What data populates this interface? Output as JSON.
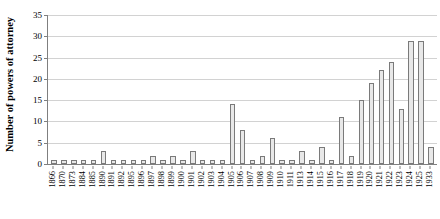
{
  "chart_data": {
    "type": "bar",
    "title": "",
    "subtitle": "",
    "xlabel": "",
    "ylabel": "Number of powers of attorney",
    "ylim": [
      0,
      35
    ],
    "yticks": [
      0,
      5,
      10,
      15,
      20,
      25,
      30,
      35
    ],
    "grid": true,
    "legend": null,
    "categories": [
      "1866",
      "1870",
      "1873",
      "1884",
      "1885",
      "1890",
      "1891",
      "1892",
      "1895",
      "1896",
      "1897",
      "1898",
      "1899",
      "1900",
      "1901",
      "1902",
      "1903",
      "1904",
      "1905",
      "1906",
      "1907",
      "1908",
      "1909",
      "1910",
      "1911",
      "1913",
      "1914",
      "1915",
      "1916",
      "1917",
      "1918",
      "1919",
      "1920",
      "1921",
      "1922",
      "1923",
      "1924",
      "1925",
      "1933"
    ],
    "values": [
      1,
      1,
      1,
      1,
      1,
      3,
      1,
      1,
      1,
      1,
      2,
      1,
      2,
      1,
      3,
      1,
      1,
      1,
      14,
      8,
      1,
      2,
      6,
      1,
      1,
      3,
      1,
      4,
      1,
      11,
      2,
      15,
      19,
      22,
      24,
      13,
      29,
      29,
      4
    ],
    "bar_color": "#e8e8e8",
    "bar_border_color": "#7a7a7a",
    "grid_color": "#d2d2d2",
    "axis_color": "#808080"
  }
}
